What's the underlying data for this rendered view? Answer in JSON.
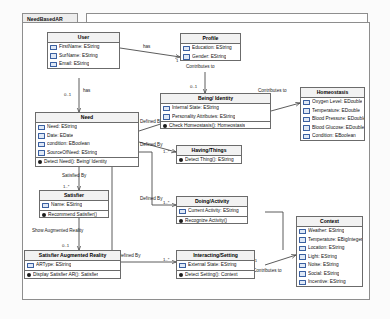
{
  "editor": {
    "tab_label": "NeedBasedAR"
  },
  "classes": [
    {
      "id": "user",
      "name": "User",
      "attributes": [
        "FirstName: EString",
        "SurName: EString",
        "Email: EString"
      ],
      "operations": []
    },
    {
      "id": "profile",
      "name": "Profile",
      "attributes": [
        "Education: EString",
        "Gender: EString"
      ],
      "operations": []
    },
    {
      "id": "being_identity",
      "name": "Being/ Identity",
      "attributes": [
        "Internal State: EString",
        "Personality Attributes: EString"
      ],
      "operations": [
        "Check Homeostasis(): Homeostasis"
      ]
    },
    {
      "id": "homeostasis",
      "name": "Homeostasis",
      "attributes": [
        "Oxygen Level: EDouble",
        "Temperature: EDouble",
        "Blood Pressure: EDouble",
        "Blood Glucose: EDouble",
        "Condition: EBoolean"
      ],
      "operations": []
    },
    {
      "id": "need",
      "name": "Need",
      "attributes": [
        "Need: EString",
        "Date: EDate",
        "condition: EBoolean",
        "SourceOfNeed: EString"
      ],
      "operations": [
        "Detect Need(): Being/ Identity"
      ]
    },
    {
      "id": "having_things",
      "name": "Having/Things",
      "attributes": [],
      "operations": [
        "Detect Thing(): EString"
      ]
    },
    {
      "id": "satisfier",
      "name": "Satisfier",
      "attributes": [
        "Name: EString"
      ],
      "operations": [
        "Recommend Satisfier()"
      ]
    },
    {
      "id": "doing_activity",
      "name": "Doing/Activity",
      "attributes": [
        "Current Activity: EString"
      ],
      "operations": [
        "Recognize Activity()"
      ]
    },
    {
      "id": "satisfier_ar",
      "name": "Satisfier Augmented Reality",
      "attributes": [
        "ARType: EString"
      ],
      "operations": [
        "Display Satisfier AR(): Satisfier"
      ]
    },
    {
      "id": "interacting_setting",
      "name": "Interacting/Setting",
      "attributes": [
        "External State: EString"
      ],
      "operations": [
        "Detect Setting(): Context"
      ]
    },
    {
      "id": "context",
      "name": "Context",
      "attributes": [
        "Weather: EString",
        "Temperature: EBigInteger",
        "Location: EString",
        "Light: EString",
        "Noise: EString",
        "Social: EString",
        "Incentive: EString"
      ],
      "operations": []
    }
  ],
  "edge_labels": {
    "user_profile": "has",
    "user_need": "has",
    "need_being": "Defined By",
    "need_having": "Defined By",
    "need_doing": "Defined By",
    "need_interacting": "Defined By",
    "need_satisfier": "Satisfied By",
    "satisfier_ar": "Show Augmented Reality",
    "profile_being": "Contributes to",
    "being_homeostasis": "Contributes to",
    "interacting_context": "Contributes to"
  },
  "multiplicities": {
    "user_profile_target": "1",
    "user_need_source": "0..1",
    "user_need_target": "1..*",
    "need_being_target": "1..*",
    "need_having_target": "1..*",
    "need_doing_target": "1..*",
    "need_interacting_target": "1..*",
    "need_satisfier_target": "1..*",
    "satisfier_ar_target": "0..1",
    "profile_being_target": "0..1",
    "being_homeostasis_source": "0..1",
    "interacting_context_source": "0..1"
  }
}
